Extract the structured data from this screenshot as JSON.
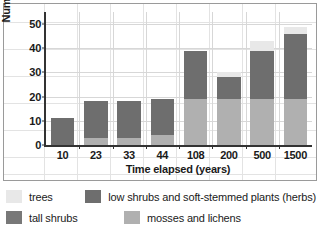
{
  "chart_data": {
    "type": "bar",
    "title": "",
    "xlabel": "Time elapsed (years)",
    "ylabel": "Number of species",
    "categories": [
      "10",
      "23",
      "33",
      "44",
      "108",
      "200",
      "500",
      "1500"
    ],
    "ylim": [
      0,
      55
    ],
    "yticks": [
      0,
      10,
      20,
      30,
      40,
      50
    ],
    "grid": true,
    "stacked": true,
    "legend_position": "bottom",
    "series": [
      {
        "name": "mosses and lichens",
        "color": "#b0b0b0",
        "values": [
          0,
          3,
          3,
          4,
          19,
          19,
          19,
          19
        ]
      },
      {
        "name": "tall shrubs",
        "color": "#787878",
        "values": [
          0,
          0,
          0,
          0,
          0,
          0,
          0,
          0
        ]
      },
      {
        "name": "low shrubs and soft-stemmed plants (herbs)",
        "color": "#6e6e6e",
        "values": [
          11,
          15,
          15,
          15,
          20,
          9,
          20,
          27
        ]
      },
      {
        "name": "trees",
        "color": "#e8e8e8",
        "values": [
          0,
          0,
          0,
          0,
          0,
          2,
          4,
          3
        ]
      }
    ],
    "totals": [
      11,
      18,
      18,
      19,
      39,
      30,
      43,
      49
    ]
  },
  "legend": {
    "entries": [
      {
        "label": "trees",
        "color": "#e8e8e8"
      },
      {
        "label": "low shrubs and soft-stemmed plants (herbs)",
        "color": "#6e6e6e"
      },
      {
        "label": "tall shrubs",
        "color": "#787878"
      },
      {
        "label": "mosses and lichens",
        "color": "#b0b0b0"
      }
    ]
  }
}
